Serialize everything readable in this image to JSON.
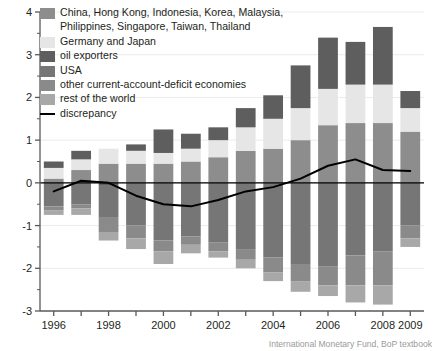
{
  "chart_data": {
    "type": "bar",
    "stacked": true,
    "title": "",
    "subtitle": "",
    "xlabel": "",
    "ylabel": "",
    "ylim": [
      -3,
      4
    ],
    "yticks": [
      -3,
      -2,
      -1,
      0,
      1,
      2,
      3,
      4
    ],
    "ytick_labels": [
      "-3",
      "-2",
      "-1",
      "0",
      "1",
      "2",
      "3",
      "4"
    ],
    "yminor_ticks": [
      -2.5,
      -1.5,
      -0.5,
      0.5,
      1.5,
      2.5,
      3.5
    ],
    "grid": true,
    "grid_axis": "y",
    "legend_position": "upper-left",
    "categories": [
      1996,
      1997,
      1998,
      1999,
      2000,
      2001,
      2002,
      2003,
      2004,
      2005,
      2006,
      2007,
      2008,
      2009
    ],
    "xtick_labels": [
      "1996",
      "",
      "1998",
      "",
      "2000",
      "",
      "2002",
      "",
      "2004",
      "",
      "2006",
      "",
      "2008",
      "2009"
    ],
    "series": [
      {
        "name": "China, Hong Kong, Indonesia, Korea, Malaysia, Philippines, Singapore, Taiwan, Thailand",
        "color": "#8d8d8d",
        "values": [
          0.1,
          0.3,
          0.45,
          0.45,
          0.45,
          0.5,
          0.6,
          0.75,
          0.8,
          1.0,
          1.35,
          1.4,
          1.4,
          1.2
        ]
      },
      {
        "name": "Germany and Japan",
        "color": "#e6e6e6",
        "values": [
          0.25,
          0.25,
          0.35,
          0.3,
          0.25,
          0.3,
          0.4,
          0.55,
          0.7,
          0.75,
          0.85,
          0.9,
          0.9,
          0.55
        ]
      },
      {
        "name": "oil exporters",
        "color": "#5e5e5e",
        "values": [
          0.15,
          0.2,
          -0.05,
          0.15,
          0.55,
          0.35,
          0.3,
          0.45,
          0.55,
          1.0,
          1.2,
          1.0,
          1.35,
          0.4
        ]
      },
      {
        "name": "USA",
        "color": "#767676",
        "values": [
          -0.55,
          -0.5,
          -0.75,
          -1.0,
          -1.35,
          -1.25,
          -1.4,
          -1.55,
          -1.75,
          -1.9,
          -1.95,
          -1.7,
          -1.6,
          -1.0
        ]
      },
      {
        "name": "other current-account-deficit economies",
        "color": "#8a8a8a",
        "values": [
          -0.1,
          -0.1,
          -0.35,
          -0.3,
          -0.25,
          -0.2,
          -0.2,
          -0.25,
          -0.35,
          -0.4,
          -0.45,
          -0.7,
          -0.8,
          -0.3
        ]
      },
      {
        "name": "rest of the world",
        "color": "#a8a8a8",
        "values": [
          -0.1,
          -0.15,
          -0.2,
          -0.25,
          -0.3,
          -0.2,
          -0.15,
          -0.2,
          -0.2,
          -0.25,
          -0.25,
          -0.4,
          -0.45,
          -0.2
        ]
      }
    ],
    "line_series": {
      "name": "discrepancy",
      "color": "#000000",
      "values": [
        -0.2,
        0.05,
        0.0,
        -0.3,
        -0.5,
        -0.55,
        -0.4,
        -0.2,
        -0.1,
        0.1,
        0.4,
        0.55,
        0.3,
        0.28
      ]
    }
  },
  "legend": {
    "items": [
      {
        "label": "China, Hong Kong, Indonesia, Korea, Malaysia,\nPhilippines, Singapore, Taiwan, Thailand",
        "color": "#8d8d8d",
        "type": "swatch",
        "two_line": true
      },
      {
        "label": "Germany and Japan",
        "color": "#e6e6e6",
        "type": "swatch",
        "two_line": false
      },
      {
        "label": "oil exporters",
        "color": "#5e5e5e",
        "type": "swatch",
        "two_line": false
      },
      {
        "label": "USA",
        "color": "#767676",
        "type": "swatch",
        "two_line": false
      },
      {
        "label": "other current-account-deficit economies",
        "color": "#8a8a8a",
        "type": "swatch",
        "two_line": false
      },
      {
        "label": "rest of the world",
        "color": "#a8a8a8",
        "type": "swatch",
        "two_line": false
      },
      {
        "label": "discrepancy",
        "color": "#000000",
        "type": "line",
        "two_line": false
      }
    ]
  },
  "credit": {
    "text": "International Monetary Fund, BoP textbook"
  },
  "colors": {
    "axis": "#58595b",
    "grid": "#ebebeb",
    "text": "#231f20",
    "credit": "#9a9a9a",
    "background": "#ffffff"
  }
}
